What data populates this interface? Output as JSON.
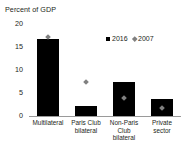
{
  "chart_data": {
    "type": "bar",
    "title": "",
    "ylabel": "Percent of GDP",
    "xlabel": "",
    "ylim": [
      0,
      20
    ],
    "yticks": [
      0,
      5,
      10,
      15,
      20
    ],
    "ytick_labels": [
      "0",
      "5",
      "10",
      "15",
      "20"
    ],
    "grid": false,
    "legend_position": "upper-right",
    "categories": [
      "Multilateral",
      "Paris Club bilateral",
      "Non-Paris Club bilateral",
      "Private sector"
    ],
    "category_lines": [
      [
        "Multilateral"
      ],
      [
        "Paris Club",
        "bilateral"
      ],
      [
        "Non-Paris",
        "Club",
        "bilateral"
      ],
      [
        "Private",
        "sector"
      ]
    ],
    "series": [
      {
        "name": "2016",
        "type": "bar",
        "color": "#000000",
        "values": [
          16.8,
          2.2,
          7.3,
          3.6
        ]
      },
      {
        "name": "2007",
        "type": "marker",
        "marker": "diamond",
        "color": "#808080",
        "values": [
          17.2,
          7.3,
          4.0,
          1.8
        ]
      }
    ]
  },
  "legend": {
    "items": [
      {
        "label": "2016",
        "swatch": "square-marker",
        "color": "#000000"
      },
      {
        "label": "2007",
        "swatch": "diamond-marker",
        "color": "#808080"
      }
    ]
  },
  "axes": {
    "y_title": "Percent of GDP"
  }
}
